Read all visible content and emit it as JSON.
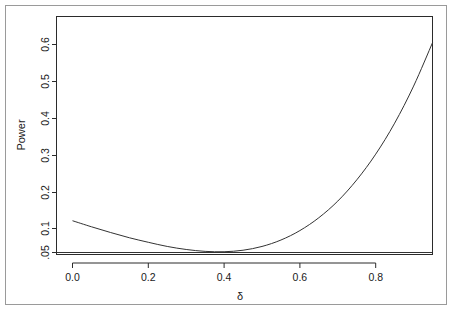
{
  "figure": {
    "background_color": "#ffffff",
    "border_color": "#9a9a9a",
    "line_color": "#333333"
  },
  "chart_data": {
    "type": "line",
    "title": "",
    "subtitle": "",
    "xlabel": "δ",
    "ylabel": "Power",
    "xlim": [
      -0.05,
      0.98
    ],
    "ylim": [
      0.035,
      0.685
    ],
    "grid": false,
    "legend": null,
    "legend_position": "none",
    "xticks": [
      0.0,
      0.2,
      0.4,
      0.6,
      0.8
    ],
    "xticklabels": [
      "0.0",
      "0.2",
      "0.4",
      "0.6",
      "0.8"
    ],
    "yticks": [
      0.05,
      0.1,
      0.2,
      0.3,
      0.4,
      0.5,
      0.6
    ],
    "yticklabels": [
      ".05",
      "0.1",
      "0.2",
      "0.3",
      "0.4",
      "0.5",
      "0.6"
    ],
    "annotations": [
      {
        "type": "hline",
        "y": 0.05,
        "label": "nominal level .05"
      }
    ],
    "series": [
      {
        "name": "Power",
        "x": [
          0.0,
          0.05,
          0.1,
          0.15,
          0.2,
          0.25,
          0.3,
          0.35,
          0.4,
          0.45,
          0.5,
          0.55,
          0.6,
          0.65,
          0.7,
          0.75,
          0.8,
          0.85,
          0.9,
          0.95
        ],
        "values": [
          0.134,
          0.118,
          0.103,
          0.089,
          0.077,
          0.066,
          0.058,
          0.053,
          0.052,
          0.056,
          0.066,
          0.083,
          0.108,
          0.142,
          0.186,
          0.242,
          0.31,
          0.392,
          0.49,
          0.605
        ]
      }
    ],
    "notes": {
      "minimum_x": 0.33,
      "minimum_y": 0.051,
      "start_y": 0.134,
      "end_x": 0.955,
      "end_y": 0.672
    }
  },
  "axes": {
    "x_axis_name": "delta-axis",
    "y_axis_name": "power-axis"
  }
}
